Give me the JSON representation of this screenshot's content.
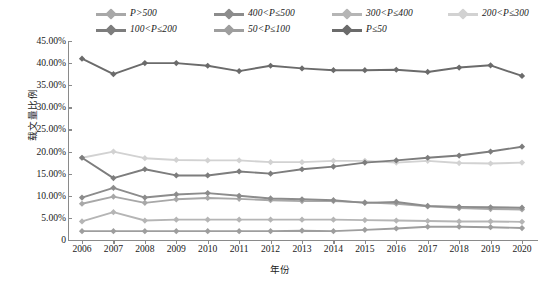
{
  "axis": {
    "y_title": "载文量比例",
    "x_title": "年份",
    "y_ticks": [
      "45.00%",
      "40.00%",
      "35.00%",
      "30.00%",
      "25.00%",
      "20.00%",
      "15.00%",
      "10.00%",
      "5.00%",
      "0"
    ]
  },
  "legend": {
    "row1": [
      "P>500",
      "400<P≤500",
      "300<P≤400",
      "200<P≤300"
    ],
    "row2": [
      "100<P≤200",
      "50<P≤100",
      "P≤50"
    ]
  },
  "chart_data": {
    "type": "line",
    "title": "",
    "xlabel": "年份",
    "ylabel": "载文量比例",
    "ylim": [
      0,
      45
    ],
    "y_unit": "%",
    "y_tick_step": 5,
    "grid": false,
    "legend_position": "top",
    "categories": [
      "2006",
      "2007",
      "2008",
      "2009",
      "2010",
      "2011",
      "2012",
      "2013",
      "2014",
      "2015",
      "2016",
      "2017",
      "2018",
      "2019",
      "2020"
    ],
    "series": [
      {
        "name": "P>500",
        "color": "#a8a8a8",
        "values": [
          8.2,
          9.8,
          8.4,
          9.2,
          9.5,
          9.3,
          9.0,
          8.8,
          8.8,
          8.5,
          8.2,
          7.6,
          7.2,
          7.0,
          6.9
        ]
      },
      {
        "name": "400<P≤500",
        "color": "#8c8c8c",
        "values": [
          9.6,
          11.8,
          9.6,
          10.3,
          10.6,
          10.0,
          9.4,
          9.2,
          9.0,
          8.4,
          8.6,
          7.7,
          7.5,
          7.4,
          7.3
        ]
      },
      {
        "name": "300<P≤400",
        "color": "#b5b5b5",
        "values": [
          4.2,
          6.3,
          4.4,
          4.6,
          4.6,
          4.6,
          4.6,
          4.6,
          4.6,
          4.5,
          4.4,
          4.3,
          4.2,
          4.2,
          4.1
        ]
      },
      {
        "name": "200<P≤300",
        "color": "#d2d2d2",
        "values": [
          18.6,
          20.0,
          18.5,
          18.1,
          18.0,
          18.0,
          17.6,
          17.6,
          17.9,
          17.9,
          17.5,
          17.9,
          17.4,
          17.3,
          17.5
        ]
      },
      {
        "name": "100<P≤200",
        "color": "#7d7d7d",
        "values": [
          18.6,
          14.0,
          16.0,
          14.6,
          14.6,
          15.5,
          15.0,
          16.0,
          16.6,
          17.5,
          18.0,
          18.6,
          19.1,
          20.0,
          21.1
        ]
      },
      {
        "name": "50<P≤100",
        "color": "#9e9e9e",
        "values": [
          2.0,
          2.0,
          2.0,
          2.0,
          2.0,
          2.0,
          2.0,
          2.1,
          2.0,
          2.3,
          2.6,
          3.0,
          3.0,
          2.9,
          2.7
        ]
      },
      {
        "name": "P≤50",
        "color": "#6b6b6b",
        "values": [
          41.0,
          37.5,
          40.0,
          40.0,
          39.4,
          38.2,
          39.4,
          38.8,
          38.4,
          38.4,
          38.5,
          38.0,
          39.0,
          39.5,
          37.1
        ]
      }
    ]
  }
}
